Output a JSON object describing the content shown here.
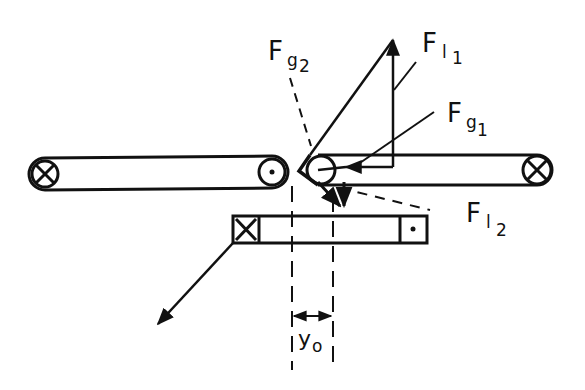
{
  "diagram": {
    "labels": {
      "fg2": {
        "main": "F",
        "sub": "g",
        "subsub": "2"
      },
      "fl1": {
        "main": "F",
        "sub": "l",
        "subsub": "1"
      },
      "fg1": {
        "main": "F",
        "sub": "g",
        "subsub": "1"
      },
      "fl2": {
        "main": "F",
        "sub": "l",
        "subsub": "2"
      },
      "y0": {
        "main": "y",
        "sub": "o"
      }
    },
    "components": [
      "left-belt",
      "right-belt",
      "lower-bar",
      "force-triangle",
      "dimension-y0"
    ],
    "colors": {
      "ink": "#111111",
      "background": "#ffffff"
    }
  }
}
